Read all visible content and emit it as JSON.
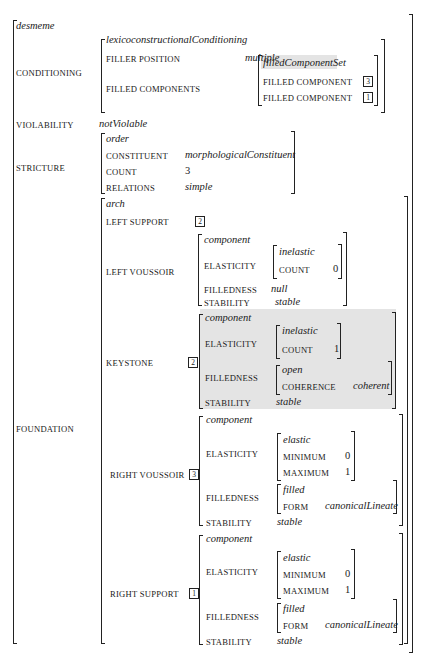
{
  "root": {
    "type": "desmeme",
    "conditioning": {
      "label": "CONDITIONING",
      "type": "lexicoconstructionalConditioning",
      "filler_position": {
        "label": "FILLER POSITION",
        "value": "multiple"
      },
      "filled_components": {
        "label": "FILLED COMPONENTS",
        "type": "filledComponentSet",
        "items": [
          {
            "label": "FILLED COMPONENT",
            "tag": "3"
          },
          {
            "label": "FILLED COMPONENT",
            "tag": "1"
          }
        ]
      }
    },
    "violability": {
      "label": "VIOLABILITY",
      "value": "notViolable"
    },
    "stricture": {
      "label": "STRICTURE",
      "type": "order",
      "constituent": {
        "label": "CONSTITUENT",
        "value": "morphologicalConstituent"
      },
      "count": {
        "label": "COUNT",
        "value": "3"
      },
      "relations": {
        "label": "RELATIONS",
        "value": "simple"
      }
    },
    "foundation": {
      "label": "FOUNDATION",
      "type": "arch",
      "left_support": {
        "label": "LEFT SUPPORT",
        "tag": "2"
      },
      "left_voussoir": {
        "label": "LEFT VOUSSOIR",
        "type": "component",
        "elasticity": {
          "label": "ELASTICITY",
          "type": "inelastic",
          "count_label": "COUNT",
          "count": "0"
        },
        "filledness": {
          "label": "FILLEDNESS",
          "value": "null"
        },
        "stability": {
          "label": "STABILITY",
          "value": "stable"
        }
      },
      "keystone": {
        "label": "KEYSTONE",
        "tag": "2",
        "type": "component",
        "elasticity": {
          "label": "ELASTICITY",
          "type": "inelastic",
          "count_label": "COUNT",
          "count": "1"
        },
        "filledness": {
          "label": "FILLEDNESS",
          "type": "open",
          "coherence_label": "COHERENCE",
          "coherence": "coherent"
        },
        "stability": {
          "label": "STABILITY",
          "value": "stable"
        }
      },
      "right_voussoir": {
        "label": "RIGHT VOUSSOIR",
        "tag": "3",
        "type": "component",
        "elasticity": {
          "label": "ELASTICITY",
          "type": "elastic",
          "min_label": "MINIMUM",
          "min": "0",
          "max_label": "MAXIMUM",
          "max": "1"
        },
        "filledness": {
          "label": "FILLEDNESS",
          "type": "filled",
          "form_label": "FORM",
          "form": "canonicalLineate"
        },
        "stability": {
          "label": "STABILITY",
          "value": "stable"
        }
      },
      "right_support": {
        "label": "RIGHT SUPPORT",
        "tag": "1",
        "type": "component",
        "elasticity": {
          "label": "ELASTICITY",
          "type": "elastic",
          "min_label": "MINIMUM",
          "min": "0",
          "max_label": "MAXIMUM",
          "max": "1"
        },
        "filledness": {
          "label": "FILLEDNESS",
          "type": "filled",
          "form_label": "FORM",
          "form": "canonicalLineate"
        },
        "stability": {
          "label": "STABILITY",
          "value": "stable"
        }
      }
    }
  }
}
